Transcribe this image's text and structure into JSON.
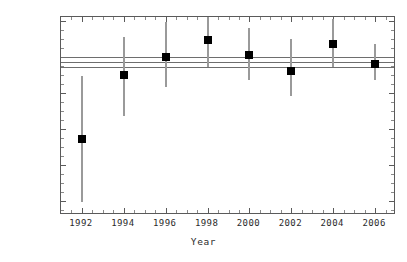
{
  "chart_data": {
    "type": "scatter",
    "title": "",
    "xlabel": "Year",
    "ylabel": "Strong coupling at Z scale",
    "xlim": [
      1991,
      2007
    ],
    "ylim": [
      0.1092,
      0.1202
    ],
    "grid": false,
    "legend": null,
    "x": [
      1992,
      1994,
      1996,
      1998,
      2000,
      2002,
      2004,
      2006
    ],
    "values": [
      0.1134,
      0.117,
      0.118,
      0.1189,
      0.1181,
      0.1172,
      0.1187,
      0.1176
    ],
    "err_low": [
      0.1099,
      0.1147,
      0.1163,
      0.1174,
      0.1167,
      0.1158,
      0.1174,
      0.1167
    ],
    "err_high": [
      0.1169,
      0.1191,
      0.1199,
      0.1203,
      0.1196,
      0.119,
      0.1201,
      0.1187
    ],
    "bands": [
      0.118,
      0.1177,
      0.1174
    ],
    "xticks": [
      1992,
      1994,
      1996,
      1998,
      2000,
      2002,
      2004,
      2006
    ],
    "xticklabels": [
      "1992",
      "1994",
      "1996",
      "1998",
      "2000",
      "2002",
      "2004",
      "2006"
    ],
    "yticks": [
      0.11,
      0.112,
      0.114,
      0.116,
      0.118,
      0.12
    ],
    "yticklabels": [
      "0.11",
      "0.112",
      "0.114",
      "0.116",
      "0.118",
      "0.12"
    ],
    "marker_color": "#000000",
    "errorbar_color": "#9a9a9a",
    "band_color": "#6e6e6e",
    "axis_color": "#5a5a5a"
  }
}
